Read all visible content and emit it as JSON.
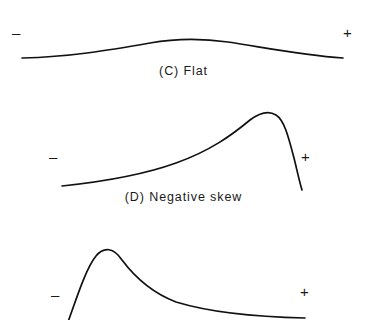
{
  "figure": {
    "background_color": "#ffffff",
    "stroke_color": "#111111",
    "panels": [
      {
        "id": "flat",
        "label": "(C) Flat",
        "axis_low_sign": "–",
        "axis_high_sign": "+",
        "shape": "flat",
        "description": "Broad shallow symmetric hump (platykurtic)"
      },
      {
        "id": "negative-skew",
        "label": "(D) Negative skew",
        "axis_low_sign": "–",
        "axis_high_sign": "+",
        "shape": "negative-skew",
        "description": "Long left tail, peak near right, steep right drop"
      },
      {
        "id": "positive-skew",
        "label": "",
        "axis_low_sign": "–",
        "axis_high_sign": "+",
        "shape": "positive-skew",
        "description": "Steep left rise, peak near left, long right tail; panel cropped at image bottom"
      }
    ]
  },
  "chart_data": {
    "type": "line",
    "title": "",
    "xlabel": "",
    "ylabel": "",
    "grid": false,
    "legend": "none",
    "axis_tick_labels": [
      "–",
      "+"
    ],
    "charts": [
      {
        "name": "(C) Flat",
        "type": "line",
        "xlim": [
          0,
          367
        ],
        "ylim": [
          100,
          0
        ],
        "path": "M 22 58 C 70 57, 110 50, 150 43 C 172 39, 200 38, 228 42 C 262 47, 300 55, 343 58",
        "x": [
          22,
          70,
          110,
          150,
          185,
          228,
          265,
          300,
          343
        ],
        "y": [
          58,
          57,
          50,
          43,
          40,
          42,
          48,
          55,
          58
        ],
        "peak_x": 185,
        "peak_y": 40,
        "baseline_y": 58
      },
      {
        "name": "(D) Negative skew",
        "type": "line",
        "xlim": [
          0,
          367
        ],
        "ylim": [
          210,
          100
        ],
        "path": "M 62 186 C 100 182, 140 176, 176 163 C 210 151, 232 135, 250 120 C 258 114, 268 110, 276 115 C 284 120, 288 135, 294 158 C 297 170, 299 180, 302 190",
        "x": [
          62,
          100,
          140,
          176,
          210,
          250,
          265,
          276,
          290,
          302
        ],
        "y": [
          186,
          182,
          176,
          163,
          151,
          120,
          113,
          115,
          148,
          190
        ],
        "peak_x": 265,
        "peak_y": 113,
        "baseline_y": 186
      },
      {
        "name": "positive skew",
        "type": "line",
        "xlim": [
          0,
          367
        ],
        "ylim": [
          320,
          210
        ],
        "path": "M 68 322 C 76 300, 86 268, 96 256 C 104 246, 114 248, 122 260 C 134 276, 150 292, 176 302 C 212 313, 260 317, 305 318",
        "x": [
          68,
          86,
          96,
          103,
          122,
          150,
          176,
          230,
          270,
          305
        ],
        "y": [
          322,
          268,
          256,
          250,
          260,
          288,
          302,
          314,
          317,
          318
        ],
        "peak_x": 103,
        "peak_y": 250,
        "baseline_y": 318
      }
    ]
  }
}
